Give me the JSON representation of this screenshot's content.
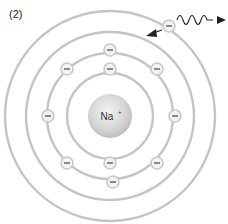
{
  "figure": {
    "panel_label": "(2)",
    "nucleus_label": "Na",
    "nucleus_charge": "+",
    "electron_symbol": "−",
    "shells": [
      {
        "name": "inner-shell",
        "electrons": 2
      },
      {
        "name": "second-shell",
        "electrons": 8
      },
      {
        "name": "third-shell",
        "electrons": 0
      },
      {
        "name": "outer-shell",
        "electrons": 1
      }
    ],
    "annotations": [
      "incoming photon wave",
      "electron transition arrow"
    ]
  }
}
